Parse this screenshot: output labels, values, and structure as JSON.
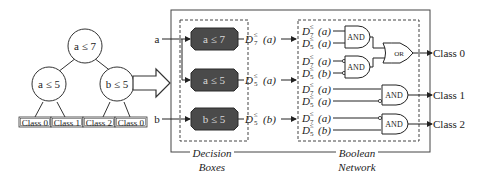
{
  "tree": {
    "root": {
      "label": "a ≤ 7"
    },
    "left": {
      "label": "a ≤ 5"
    },
    "right": {
      "label": "b ≤ 5"
    },
    "leaves": [
      {
        "label": "Class 0"
      },
      {
        "label": "Class 1"
      },
      {
        "label": "Class 2"
      },
      {
        "label": "Class 0"
      }
    ]
  },
  "inputs": [
    {
      "label": "a"
    },
    {
      "label": "b"
    }
  ],
  "decision_boxes": {
    "caption_line1": "Decision",
    "caption_line2": "Boxes",
    "boxes": [
      {
        "label": "a ≤ 7",
        "output": {
          "D": "D",
          "sup": "≤",
          "sub": "7",
          "arg": "(a)"
        }
      },
      {
        "label": "a ≤ 5",
        "output": {
          "D": "D",
          "sup": "≤",
          "sub": "5",
          "arg": "(a)"
        }
      },
      {
        "label": "b ≤ 5",
        "output": {
          "D": "D",
          "sup": "≤",
          "sub": "5",
          "arg": "(b)"
        }
      }
    ]
  },
  "boolean_network": {
    "caption_line1": "Boolean",
    "caption_line2": "Network",
    "input_terms": [
      {
        "D": "D",
        "sup": "≤",
        "sub": "7",
        "arg": "(a)",
        "negated": false
      },
      {
        "D": "D",
        "sup": "≤",
        "sub": "5",
        "arg": "(a)",
        "negated": false
      },
      {
        "D": "D",
        "sup": "≤",
        "sub": "7",
        "arg": "(a)",
        "negated": true
      },
      {
        "D": "D",
        "sup": "≤",
        "sub": "5",
        "arg": "(b)",
        "negated": true
      },
      {
        "D": "D",
        "sup": "≤",
        "sub": "7",
        "arg": "(a)",
        "negated": false
      },
      {
        "D": "D",
        "sup": "≤",
        "sub": "5",
        "arg": "(a)",
        "negated": true
      },
      {
        "D": "D",
        "sup": "≤",
        "sub": "7",
        "arg": "(a)",
        "negated": true
      },
      {
        "D": "D",
        "sup": "≤",
        "sub": "5",
        "arg": "(b)",
        "negated": false
      }
    ],
    "gates": [
      {
        "type": "AND",
        "label": "AND"
      },
      {
        "type": "AND",
        "label": "AND"
      },
      {
        "type": "OR",
        "label": "OR"
      },
      {
        "type": "AND",
        "label": "AND"
      },
      {
        "type": "AND",
        "label": "AND"
      }
    ],
    "outputs": [
      {
        "label": "Class 0"
      },
      {
        "label": "Class 1"
      },
      {
        "label": "Class 2"
      }
    ]
  },
  "colors": {
    "decision_box_fill": "#4a4a4a",
    "decision_box_text": "#d8d8d8",
    "line": "#333333"
  }
}
